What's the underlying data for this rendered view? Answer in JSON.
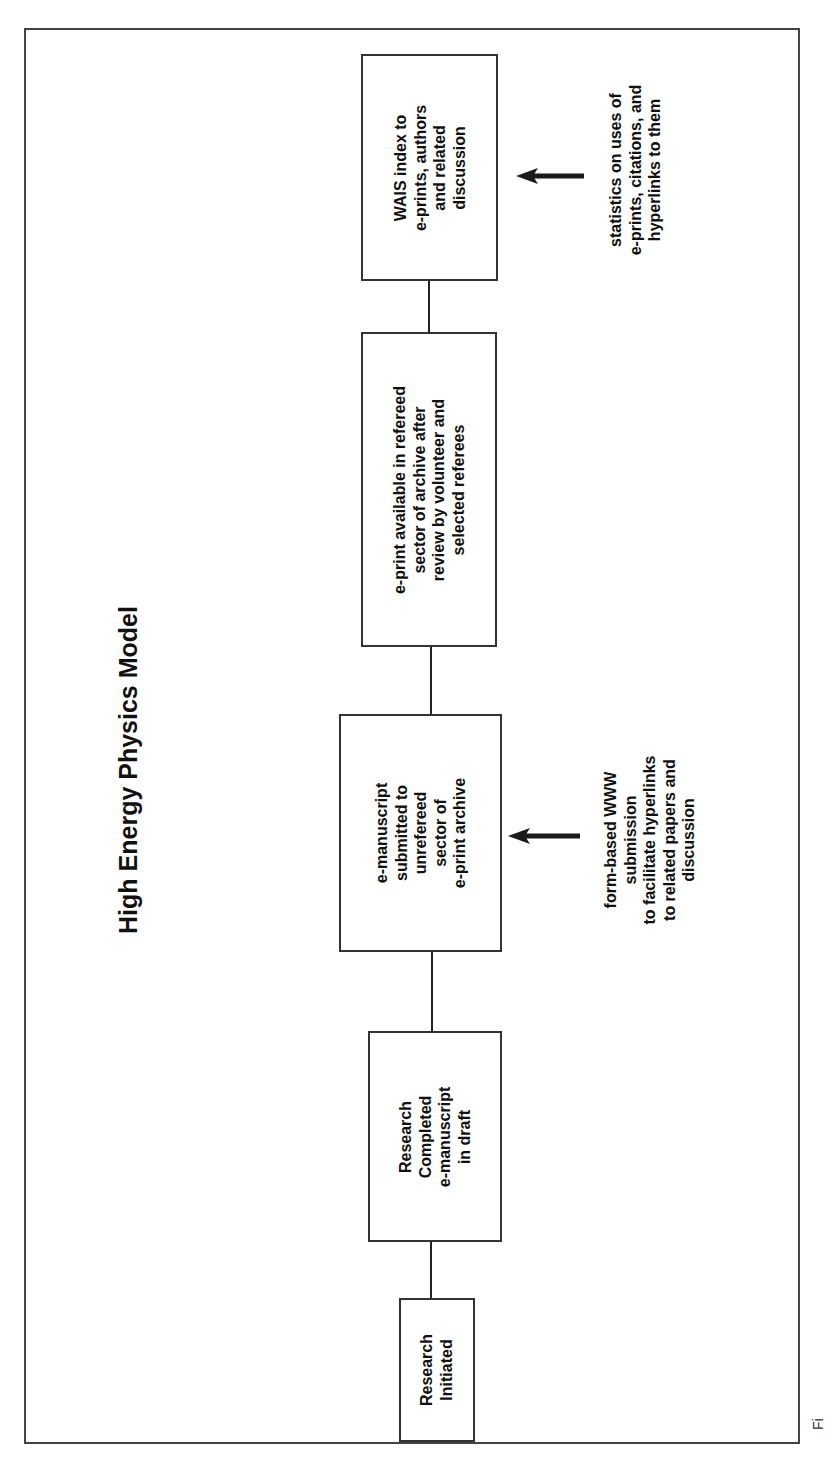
{
  "diagram": {
    "title": "High Energy Physics Model",
    "orientation": "rotated 90° counter-clockwise (text reads bottom-to-top)",
    "boxes": [
      {
        "id": "research-initiated",
        "lines": [
          "Research",
          "Initiated"
        ]
      },
      {
        "id": "research-completed",
        "lines": [
          "Research",
          "Completed",
          "e-manuscript",
          "in draft"
        ]
      },
      {
        "id": "e-manuscript-submitted",
        "lines": [
          "e-manuscript",
          "submitted to",
          "unrefereed",
          "sector of",
          "e-print archive"
        ]
      },
      {
        "id": "e-print-refereed",
        "lines": [
          "e-print available in refereed",
          "sector of archive after",
          "review by volunteer and",
          "selected referees"
        ]
      },
      {
        "id": "wais-index",
        "lines": [
          "WAIS index to",
          "e-prints, authors",
          "and related",
          "discussion"
        ]
      }
    ],
    "annotations": [
      {
        "id": "form-based-submission",
        "target": "e-manuscript-submitted",
        "lines": [
          "form-based WWW",
          "submission",
          "to facilitate hyperlinks",
          "to related papers and",
          "discussion"
        ]
      },
      {
        "id": "statistics",
        "target": "wais-index",
        "lines": [
          "statistics on uses of",
          "e-prints, citations, and",
          "hyperlinks to them"
        ]
      }
    ],
    "caption_partial": "Fi"
  },
  "colors": {
    "line": "#333333",
    "text": "#111111",
    "background": "#ffffff"
  }
}
